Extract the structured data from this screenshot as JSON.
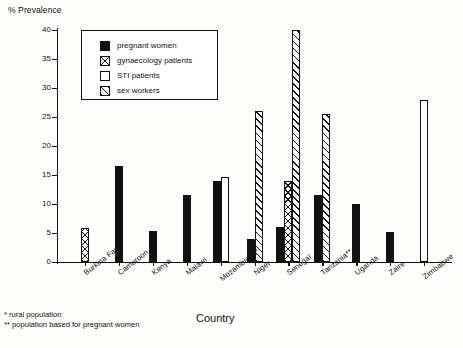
{
  "chart_data": {
    "type": "bar",
    "title": "",
    "ylabel": "% Prevalence",
    "xlabel": "Country",
    "ylim": [
      0,
      40
    ],
    "yticks": [
      0,
      5,
      10,
      15,
      20,
      25,
      30,
      35,
      40
    ],
    "grid": false,
    "legend_position": "top-left-inset",
    "categories": [
      "Burkina Faso",
      "Cameroon",
      "Kenya",
      "Malawi",
      "Mozambique*",
      "Niger",
      "Senegal",
      "Tanzania**",
      "Uganda",
      "Zaire",
      "Zimbabwe"
    ],
    "series": [
      {
        "name": "pregnant women",
        "pattern": "solid-black",
        "values": [
          null,
          16.5,
          5.3,
          11.5,
          14.0,
          4.0,
          6.0,
          11.5,
          10.0,
          5.1,
          null
        ]
      },
      {
        "name": "gynaecology patients",
        "pattern": "cross-hatch-x",
        "values": [
          5.8,
          null,
          null,
          null,
          null,
          null,
          14.0,
          null,
          null,
          null,
          null
        ]
      },
      {
        "name": "STI patients",
        "pattern": "white-open",
        "values": [
          null,
          null,
          null,
          null,
          14.7,
          null,
          null,
          null,
          null,
          null,
          28.0
        ]
      },
      {
        "name": "sex workers",
        "pattern": "diagonal-hatch",
        "values": [
          null,
          null,
          null,
          null,
          null,
          26.0,
          40.0,
          25.5,
          null,
          null,
          null
        ]
      }
    ],
    "annotations": [
      "* rural population",
      "** population based for pregnant women"
    ]
  },
  "legend": {
    "items": [
      {
        "label": "pregnant women"
      },
      {
        "label": "gynaecology patients"
      },
      {
        "label": "STI patients"
      },
      {
        "label": "sex workers"
      }
    ]
  },
  "footnotes": {
    "rural": "* rural population",
    "pregnant": "** population based for pregnant women"
  },
  "colors": {
    "ink": "#111111",
    "paper": "#fdfdfb"
  }
}
